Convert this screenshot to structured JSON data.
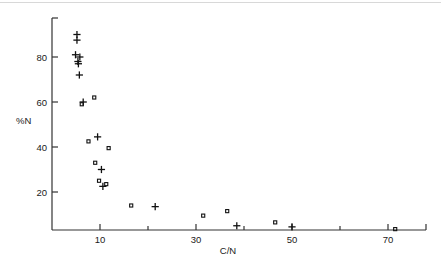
{
  "chart_data": {
    "type": "scatter",
    "title": "",
    "subtitle": "",
    "xlabel": "C/N",
    "ylabel": "%N",
    "xlim": [
      2,
      80
    ],
    "ylim": [
      0,
      97
    ],
    "grid": false,
    "legend": "none",
    "x_ticks_major": [
      10,
      30,
      50,
      70
    ],
    "x_ticks_minor": [
      20,
      40,
      60
    ],
    "x_tick_labels": [
      "10",
      "30",
      "50",
      "70"
    ],
    "y_ticks_major": [
      20,
      40,
      60,
      80
    ],
    "y_tick_labels": [
      "20",
      "40",
      "60",
      "80"
    ],
    "series": [
      {
        "name": "cross",
        "marker": "plus",
        "color": "#111111",
        "points": [
          {
            "x": 5.2,
            "y": 90.0
          },
          {
            "x": 5.2,
            "y": 87.5
          },
          {
            "x": 4.9,
            "y": 81.0
          },
          {
            "x": 5.8,
            "y": 80.0
          },
          {
            "x": 5.4,
            "y": 78.0
          },
          {
            "x": 5.5,
            "y": 77.0
          },
          {
            "x": 5.7,
            "y": 72.0
          },
          {
            "x": 6.5,
            "y": 60.0
          },
          {
            "x": 9.5,
            "y": 44.5
          },
          {
            "x": 10.3,
            "y": 30.0
          },
          {
            "x": 10.6,
            "y": 22.5
          },
          {
            "x": 21.5,
            "y": 13.5
          },
          {
            "x": 38.5,
            "y": 5.0
          },
          {
            "x": 50.0,
            "y": 4.5
          }
        ]
      },
      {
        "name": "square",
        "marker": "open-square",
        "color": "#111111",
        "points": [
          {
            "x": 6.2,
            "y": 59.0
          },
          {
            "x": 8.8,
            "y": 62.0
          },
          {
            "x": 7.6,
            "y": 42.5
          },
          {
            "x": 11.8,
            "y": 39.5
          },
          {
            "x": 9.0,
            "y": 33.0
          },
          {
            "x": 9.8,
            "y": 25.0
          },
          {
            "x": 11.3,
            "y": 23.5
          },
          {
            "x": 16.5,
            "y": 14.0
          },
          {
            "x": 31.5,
            "y": 9.5
          },
          {
            "x": 36.5,
            "y": 11.5
          },
          {
            "x": 46.5,
            "y": 6.5
          },
          {
            "x": 71.5,
            "y": 3.5
          }
        ]
      }
    ]
  },
  "axes": {
    "x_axis_name": "C/N",
    "y_axis_name": "%N"
  }
}
